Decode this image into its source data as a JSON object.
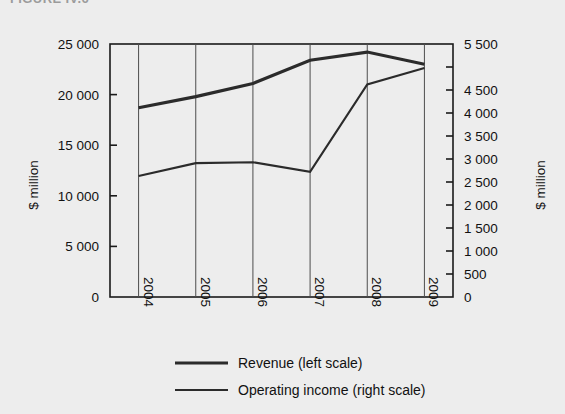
{
  "clipped_heading": "FIGURE IV.6",
  "chart_data": {
    "type": "line",
    "title": "",
    "x": [
      "2004",
      "2005",
      "2006",
      "2007",
      "2008",
      "2009"
    ],
    "categories": [
      "2004",
      "2005",
      "2006",
      "2007",
      "2008",
      "2009"
    ],
    "series": [
      {
        "name": "Revenue (left scale)",
        "axis": "left",
        "values": [
          18700,
          19800,
          21100,
          23400,
          24200,
          23000
        ]
      },
      {
        "name": "Operating income (right scale)",
        "axis": "right",
        "values": [
          2630,
          2910,
          2930,
          2720,
          4620,
          4980
        ]
      }
    ],
    "left_axis": {
      "label": "$ million",
      "ticks": [
        "0",
        "5 000",
        "10 000",
        "15 000",
        "20 000",
        "25 000"
      ],
      "tick_values": [
        0,
        5000,
        10000,
        15000,
        20000,
        25000
      ],
      "ylim": [
        0,
        25000
      ]
    },
    "right_axis": {
      "label": "$ million",
      "ticks": [
        "0",
        "500",
        "1 000",
        "1 500",
        "2 000",
        "2 500",
        "3 000",
        "3 500",
        "4 000",
        "4 500",
        "",
        "5 500"
      ],
      "tick_values": [
        0,
        500,
        1000,
        1500,
        2000,
        2500,
        3000,
        3500,
        4000,
        4500,
        5000,
        5500
      ],
      "ylim": [
        0,
        5500
      ]
    },
    "xlabel": "",
    "grid": "vertical",
    "legend_position": "bottom",
    "legend": [
      "Revenue (left scale)",
      "Operating income (right scale)"
    ],
    "colors": {
      "line": "#2b2b2b",
      "grid": "#4d4d4d",
      "axis": "#1a1a1a",
      "background": "#ededed"
    }
  }
}
